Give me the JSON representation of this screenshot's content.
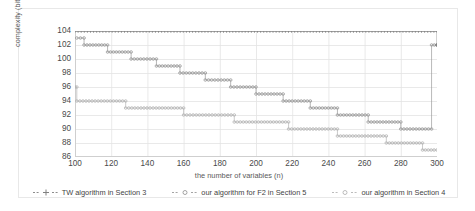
{
  "chart_data": {
    "type": "line",
    "title": "",
    "xlabel": "the number of variables (n)",
    "ylabel": "complexity (bits)",
    "xlim": [
      100,
      300
    ],
    "ylim": [
      86,
      104
    ],
    "xticks": [
      100,
      120,
      140,
      160,
      180,
      200,
      220,
      240,
      260,
      280,
      300
    ],
    "yticks": [
      86,
      88,
      90,
      92,
      94,
      96,
      98,
      100,
      102,
      104
    ],
    "grid": true,
    "legend_position": "bottom",
    "series": [
      {
        "name": "TW algorithm in Section 3",
        "marker": "plus",
        "color": "#808080",
        "x": [
          100,
          104,
          108,
          112,
          116,
          120,
          124,
          128,
          132,
          136,
          140,
          144,
          148,
          152,
          156,
          160,
          164,
          168,
          172,
          176,
          180,
          184,
          188,
          192,
          196,
          200,
          204,
          208,
          212,
          216,
          220,
          224,
          228,
          232,
          236,
          240,
          244,
          248,
          252,
          256,
          260,
          264,
          268,
          272,
          276,
          280,
          284,
          288,
          292,
          296,
          300
        ],
        "values": [
          104,
          104,
          104,
          104,
          104,
          104,
          104,
          104,
          104,
          104,
          104,
          104,
          104,
          104,
          104,
          104,
          104,
          104,
          104,
          104,
          104,
          104,
          104,
          104,
          104,
          104,
          104,
          104,
          104,
          104,
          104,
          104,
          104,
          104,
          104,
          104,
          104,
          104,
          104,
          104,
          104,
          104,
          104,
          104,
          104,
          104,
          104,
          104,
          104,
          104,
          102
        ]
      },
      {
        "name": "our algorithm for F2 in Section 5",
        "marker": "circle",
        "color": "#9a9a9a",
        "x": [
          100,
          104,
          108,
          112,
          116,
          120,
          124,
          128,
          132,
          136,
          140,
          144,
          148,
          152,
          156,
          160,
          164,
          168,
          172,
          176,
          180,
          184,
          188,
          192,
          196,
          200,
          204,
          208,
          212,
          216,
          220,
          224,
          228,
          232,
          236,
          240,
          244,
          248,
          252,
          256,
          260,
          264,
          268,
          272,
          276,
          280,
          284,
          288,
          292,
          296,
          300
        ],
        "values": [
          103,
          102,
          102,
          102,
          101,
          101,
          101,
          100,
          100,
          100,
          99,
          99,
          99,
          98,
          98,
          98,
          97,
          97,
          97,
          96,
          96,
          96,
          96,
          95,
          95,
          95,
          95,
          94,
          94,
          94,
          94,
          93,
          93,
          93,
          93,
          92,
          92,
          92,
          92,
          92,
          91,
          91,
          91,
          91,
          91,
          90,
          90,
          90,
          90,
          90,
          102
        ]
      },
      {
        "name": "our algorithm in Section 4",
        "marker": "circle",
        "color": "#b4b4b4",
        "x": [
          100,
          104,
          108,
          112,
          116,
          120,
          124,
          128,
          132,
          136,
          140,
          144,
          148,
          152,
          156,
          160,
          164,
          168,
          172,
          176,
          180,
          184,
          188,
          192,
          196,
          200,
          204,
          208,
          212,
          216,
          220,
          224,
          228,
          232,
          236,
          240,
          244,
          248,
          252,
          256,
          260,
          264,
          268,
          272,
          276,
          280,
          284,
          288,
          292,
          296,
          300
        ],
        "values": [
          96,
          94,
          94,
          94,
          94,
          94,
          94,
          94,
          93,
          93,
          93,
          93,
          93,
          93,
          93,
          92,
          92,
          92,
          92,
          92,
          92,
          92,
          91,
          91,
          91,
          91,
          91,
          91,
          91,
          90,
          90,
          90,
          90,
          90,
          90,
          90,
          89,
          89,
          89,
          89,
          89,
          89,
          88,
          88,
          88,
          88,
          88,
          88,
          87,
          87,
          87
        ]
      }
    ],
    "step_segments": {
      "tw": [
        {
          "x0": 100,
          "x1": 300,
          "y": 104
        },
        {
          "x0": 300,
          "x1": 300,
          "y": 102
        }
      ],
      "f2_section5": [
        {
          "x0": 101,
          "x1": 105,
          "y": 103
        },
        {
          "x0": 105,
          "x1": 118,
          "y": 102
        },
        {
          "x0": 118,
          "x1": 131,
          "y": 101
        },
        {
          "x0": 131,
          "x1": 145,
          "y": 100
        },
        {
          "x0": 145,
          "x1": 158,
          "y": 99
        },
        {
          "x0": 158,
          "x1": 172,
          "y": 98
        },
        {
          "x0": 172,
          "x1": 186,
          "y": 97
        },
        {
          "x0": 186,
          "x1": 200,
          "y": 96
        },
        {
          "x0": 200,
          "x1": 215,
          "y": 95
        },
        {
          "x0": 215,
          "x1": 230,
          "y": 94
        },
        {
          "x0": 230,
          "x1": 245,
          "y": 93
        },
        {
          "x0": 245,
          "x1": 262,
          "y": 92
        },
        {
          "x0": 262,
          "x1": 280,
          "y": 91
        },
        {
          "x0": 280,
          "x1": 297,
          "y": 90
        },
        {
          "x0": 297,
          "x1": 300,
          "y": 102
        }
      ],
      "section4": [
        {
          "x0": 100,
          "x1": 101,
          "y": 96
        },
        {
          "x0": 101,
          "x1": 128,
          "y": 94
        },
        {
          "x0": 128,
          "x1": 160,
          "y": 93
        },
        {
          "x0": 160,
          "x1": 188,
          "y": 92
        },
        {
          "x0": 188,
          "x1": 218,
          "y": 91
        },
        {
          "x0": 218,
          "x1": 245,
          "y": 90
        },
        {
          "x0": 245,
          "x1": 272,
          "y": 89
        },
        {
          "x0": 272,
          "x1": 292,
          "y": 88
        },
        {
          "x0": 292,
          "x1": 300,
          "y": 87
        }
      ]
    }
  },
  "legend": {
    "items": [
      {
        "label": "TW algorithm in Section 3",
        "marker": "plus-marker",
        "color": "#808080"
      },
      {
        "label": "our algorithm for F2 in Section 5",
        "marker": "circle-marker",
        "color": "#9a9a9a"
      },
      {
        "label": "our algorithm in Section 4",
        "marker": "circle-marker",
        "color": "#b4b4b4"
      }
    ]
  }
}
